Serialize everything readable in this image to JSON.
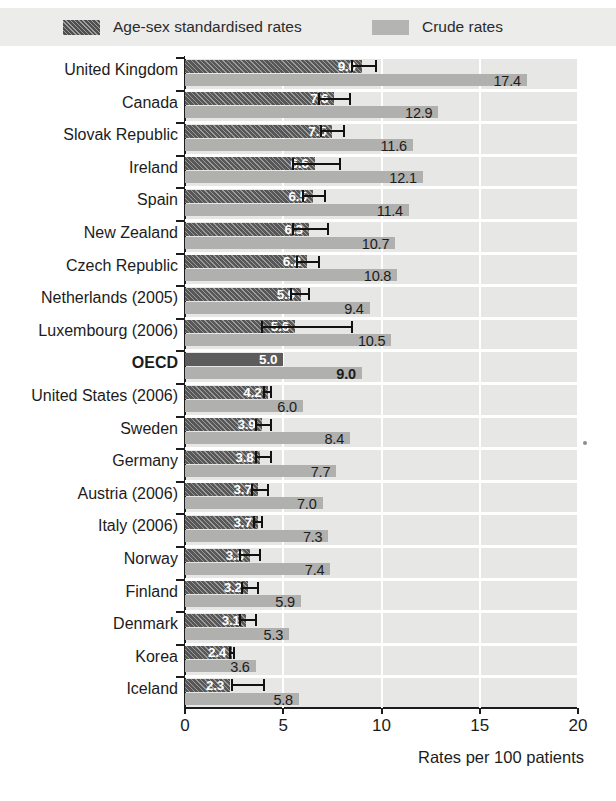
{
  "legend": {
    "items": [
      {
        "label": "Age-sex standardised rates",
        "swatch": "dark-hatched-swatch-icon",
        "color": "#4f4f4f"
      },
      {
        "label": "Crude rates",
        "swatch": "light-gray-swatch-icon",
        "color": "#b4b4b2"
      }
    ]
  },
  "axis": {
    "xlabel": "Rates per 100 patients",
    "ticks": [
      "0",
      "5",
      "10",
      "15",
      "20"
    ]
  },
  "chart_data": {
    "type": "bar",
    "orientation": "horizontal",
    "title": "",
    "xlabel": "Rates per 100 patients",
    "ylabel": "",
    "xlim": [
      0,
      20
    ],
    "grid": "vertical-white-gridlines-at-5-10-15-20",
    "legend_position": "top",
    "categories": [
      "United Kingdom",
      "Canada",
      "Slovak Republic",
      "Ireland",
      "Spain",
      "New Zealand",
      "Czech Republic",
      "Netherlands (2005)",
      "Luxembourg (2006)",
      "OECD",
      "United States (2006)",
      "Sweden",
      "Germany",
      "Austria (2006)",
      "Italy (2006)",
      "Norway",
      "Finland",
      "Denmark",
      "Korea",
      "Iceland"
    ],
    "series": [
      {
        "name": "Age-sex standardised rates",
        "color": "#575757",
        "values": [
          9.0,
          7.6,
          7.5,
          6.6,
          6.5,
          6.3,
          6.2,
          5.9,
          5.6,
          5.0,
          4.2,
          3.9,
          3.8,
          3.7,
          3.7,
          3.3,
          3.2,
          3.1,
          2.4,
          2.3
        ]
      },
      {
        "name": "Crude rates",
        "color": "#b0b0ae",
        "values": [
          17.4,
          12.9,
          11.6,
          12.1,
          11.4,
          10.7,
          10.8,
          9.4,
          10.5,
          9.0,
          6.0,
          8.4,
          7.7,
          7.0,
          7.3,
          7.4,
          5.9,
          5.3,
          3.6,
          5.8
        ]
      }
    ],
    "error_bars": {
      "applies_to": "Age-sex standardised rates",
      "intervals": [
        {
          "category": "United Kingdom",
          "low": 8.5,
          "high": 9.7
        },
        {
          "category": "Canada",
          "low": 6.8,
          "high": 8.4
        },
        {
          "category": "Slovak Republic",
          "low": 6.9,
          "high": 8.1
        },
        {
          "category": "Ireland",
          "low": 5.5,
          "high": 7.9
        },
        {
          "category": "Spain",
          "low": 6.0,
          "high": 7.1
        },
        {
          "category": "New Zealand",
          "low": 5.5,
          "high": 7.3
        },
        {
          "category": "Czech Republic",
          "low": 5.7,
          "high": 6.8
        },
        {
          "category": "Netherlands (2005)",
          "low": 5.4,
          "high": 6.3
        },
        {
          "category": "Luxembourg (2006)",
          "low": 3.9,
          "high": 8.5
        },
        {
          "category": "OECD",
          "low": null,
          "high": null
        },
        {
          "category": "United States (2006)",
          "low": 4.0,
          "high": 4.4
        },
        {
          "category": "Sweden",
          "low": 3.6,
          "high": 4.4
        },
        {
          "category": "Germany",
          "low": 3.6,
          "high": 4.4
        },
        {
          "category": "Austria (2006)",
          "low": 3.4,
          "high": 4.2
        },
        {
          "category": "Italy (2006)",
          "low": 3.5,
          "high": 3.9
        },
        {
          "category": "Norway",
          "low": 2.8,
          "high": 3.8
        },
        {
          "category": "Finland",
          "low": 2.9,
          "high": 3.7
        },
        {
          "category": "Denmark",
          "low": 2.8,
          "high": 3.6
        },
        {
          "category": "Korea",
          "low": 2.3,
          "high": 2.5
        },
        {
          "category": "Iceland",
          "low": 2.4,
          "high": 4.0
        }
      ]
    },
    "rows": [
      {
        "category": "United Kingdom",
        "std": "9.0",
        "crude": "17.4",
        "bold": false
      },
      {
        "category": "Canada",
        "std": "7.6",
        "crude": "12.9",
        "bold": false
      },
      {
        "category": "Slovak Republic",
        "std": "7.5",
        "crude": "11.6",
        "bold": false
      },
      {
        "category": "Ireland",
        "std": "6.6",
        "crude": "12.1",
        "bold": false
      },
      {
        "category": "Spain",
        "std": "6.5",
        "crude": "11.4",
        "bold": false
      },
      {
        "category": "New Zealand",
        "std": "6.3",
        "crude": "10.7",
        "bold": false
      },
      {
        "category": "Czech Republic",
        "std": "6.2",
        "crude": "10.8",
        "bold": false
      },
      {
        "category": "Netherlands (2005)",
        "std": "5.9",
        "crude": "9.4",
        "bold": false
      },
      {
        "category": "Luxembourg (2006)",
        "std": "5.6",
        "crude": "10.5",
        "bold": false
      },
      {
        "category": "OECD",
        "std": "5.0",
        "crude": "9.0",
        "bold": true
      },
      {
        "category": "United States (2006)",
        "std": "4.2",
        "crude": "6.0",
        "bold": false
      },
      {
        "category": "Sweden",
        "std": "3.9",
        "crude": "8.4",
        "bold": false
      },
      {
        "category": "Germany",
        "std": "3.8",
        "crude": "7.7",
        "bold": false
      },
      {
        "category": "Austria (2006)",
        "std": "3.7",
        "crude": "7.0",
        "bold": false
      },
      {
        "category": "Italy (2006)",
        "std": "3.7",
        "crude": "7.3",
        "bold": false
      },
      {
        "category": "Norway",
        "std": "3.3",
        "crude": "7.4",
        "bold": false
      },
      {
        "category": "Finland",
        "std": "3.2",
        "crude": "5.9",
        "bold": false
      },
      {
        "category": "Denmark",
        "std": "3.1",
        "crude": "5.3",
        "bold": false
      },
      {
        "category": "Korea",
        "std": "2.4",
        "crude": "3.6",
        "bold": false
      },
      {
        "category": "Iceland",
        "std": "2.3",
        "crude": "5.8",
        "bold": false
      }
    ]
  }
}
